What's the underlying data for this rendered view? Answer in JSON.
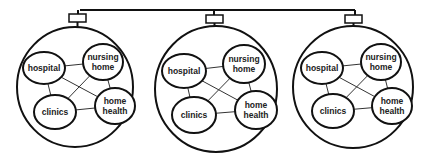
{
  "diagram": {
    "bus": {
      "y": 10,
      "x1": 80,
      "x2": 355
    },
    "colors": {
      "line": "#111111",
      "text": "#222222",
      "background": "#ffffff"
    },
    "networks": [
      {
        "id": "network-1",
        "outer": {
          "cx": 75,
          "cy": 87,
          "rx": 58,
          "ry": 60
        },
        "connector": {
          "x": 69,
          "y": 14,
          "w": 17,
          "h": 8,
          "stem_x": 78
        },
        "nodes": [
          {
            "id": "hospital",
            "lines": [
              "hospital"
            ],
            "cx": 44,
            "cy": 68,
            "rx": 21,
            "ry": 16
          },
          {
            "id": "nursing-home",
            "lines": [
              "nursing",
              "home"
            ],
            "cx": 103,
            "cy": 62,
            "rx": 20,
            "ry": 18
          },
          {
            "id": "clinics",
            "lines": [
              "clinics"
            ],
            "cx": 55,
            "cy": 112,
            "rx": 21,
            "ry": 17
          },
          {
            "id": "home-health",
            "lines": [
              "home",
              "health"
            ],
            "cx": 115,
            "cy": 106,
            "rx": 20,
            "ry": 18
          }
        ]
      },
      {
        "id": "network-2",
        "outer": {
          "cx": 216,
          "cy": 89,
          "rx": 61,
          "ry": 63
        },
        "connector": {
          "x": 206,
          "y": 15,
          "w": 17,
          "h": 8,
          "stem_x": 214
        },
        "nodes": [
          {
            "id": "hospital",
            "lines": [
              "hospital"
            ],
            "cx": 184,
            "cy": 71,
            "rx": 22,
            "ry": 17
          },
          {
            "id": "nursing-home",
            "lines": [
              "nursing",
              "home"
            ],
            "cx": 244,
            "cy": 64,
            "rx": 21,
            "ry": 19
          },
          {
            "id": "clinics",
            "lines": [
              "clinics"
            ],
            "cx": 194,
            "cy": 115,
            "rx": 22,
            "ry": 18
          },
          {
            "id": "home-health",
            "lines": [
              "home",
              "health"
            ],
            "cx": 256,
            "cy": 110,
            "rx": 21,
            "ry": 19
          }
        ]
      },
      {
        "id": "network-3",
        "outer": {
          "cx": 353,
          "cy": 87,
          "rx": 60,
          "ry": 61
        },
        "connector": {
          "x": 345,
          "y": 15,
          "w": 17,
          "h": 8,
          "stem_x": 355
        },
        "nodes": [
          {
            "id": "hospital",
            "lines": [
              "hospital"
            ],
            "cx": 322,
            "cy": 68,
            "rx": 21,
            "ry": 16
          },
          {
            "id": "nursing-home",
            "lines": [
              "nursing",
              "home"
            ],
            "cx": 381,
            "cy": 62,
            "rx": 20,
            "ry": 18
          },
          {
            "id": "clinics",
            "lines": [
              "clinics"
            ],
            "cx": 333,
            "cy": 111,
            "rx": 21,
            "ry": 17
          },
          {
            "id": "home-health",
            "lines": [
              "home",
              "health"
            ],
            "cx": 392,
            "cy": 106,
            "rx": 20,
            "ry": 18
          }
        ]
      }
    ],
    "links": [
      [
        "hospital",
        "nursing-home"
      ],
      [
        "hospital",
        "clinics"
      ],
      [
        "hospital",
        "home-health"
      ],
      [
        "nursing-home",
        "clinics"
      ],
      [
        "nursing-home",
        "home-health"
      ],
      [
        "clinics",
        "home-health"
      ]
    ]
  }
}
